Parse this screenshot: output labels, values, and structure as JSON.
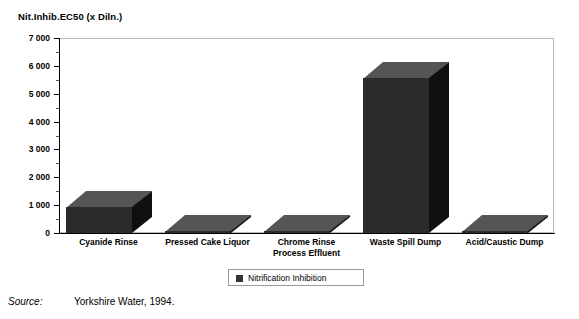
{
  "chart_data": {
    "type": "bar",
    "title": "Nit.Inhib.EC50 (x Diln.)",
    "xlabel": "",
    "ylabel": "Nit.Inhib.EC50 (x Diln.)",
    "categories": [
      "Cyanide Rinse",
      "Pressed Cake Liquor",
      "Chrome Rinse Process Effluent",
      "Waste Spill Dump",
      "Acid/Caustic Dump"
    ],
    "category_lines": [
      [
        "Cyanide Rinse"
      ],
      [
        "Pressed Cake Liquor"
      ],
      [
        "Chrome Rinse",
        "Process Effluent"
      ],
      [
        "Waste Spill Dump"
      ],
      [
        "Acid/Caustic Dump"
      ]
    ],
    "series": [
      {
        "name": "Nitrification Inhibition",
        "values": [
          930,
          20,
          20,
          5560,
          20
        ]
      }
    ],
    "ylim": [
      0,
      7000
    ],
    "ytick_step": 1000,
    "yminor_step": 500,
    "ytick_labels": [
      "0",
      "1 000",
      "2 000",
      "3 000",
      "4 000",
      "5 000",
      "6 000",
      "7 000"
    ],
    "grid": false,
    "legend_position": "bottom-center",
    "style": "3d-bar",
    "colors": {
      "bar_front": "#2b2b2b",
      "bar_top": "#555555",
      "bar_side": "#101010",
      "legend_swatch": "#333333",
      "frame": "#b9b9b9",
      "axis": "#000000",
      "background": "#ffffff"
    }
  },
  "legend": {
    "entries": [
      {
        "label": "Nitrification Inhibition",
        "swatch": "#333333"
      }
    ]
  },
  "source": {
    "label": "Source:",
    "text": "Yorkshire Water, 1994."
  },
  "axis": {
    "y_labels": [
      "7 000",
      "6 000",
      "5 000",
      "4 000",
      "3 000",
      "2 000",
      "1 000",
      "0"
    ]
  }
}
